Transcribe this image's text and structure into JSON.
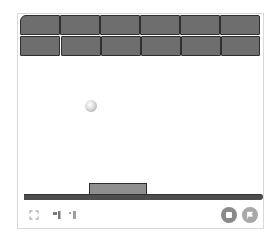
{
  "game": {
    "title": "Breakout",
    "colors": {
      "brick_fill": "#6e6e6e",
      "brick_border": "#2f2f2f",
      "paddle_fill": "#8f8f8f",
      "floor": "#4d4d4d",
      "frame_border": "#d9d9d9",
      "button_stop": "#8a8a8a",
      "button_go": "#a8a8a8"
    },
    "bricks": {
      "rows": 2,
      "columns": 6,
      "grid": [
        [
          1,
          1,
          1,
          1,
          1,
          1
        ],
        [
          1,
          1,
          1,
          1,
          1,
          1
        ]
      ]
    },
    "ball": {
      "x": 90,
      "y": 105
    },
    "paddle": {
      "x": 88,
      "y": 182,
      "width": 58
    }
  },
  "controls": {
    "left": [
      {
        "name": "fullscreen",
        "icon": "fullscreen-icon"
      },
      {
        "name": "small-stage",
        "icon": "small-stage-icon"
      },
      {
        "name": "normal-stage",
        "icon": "normal-stage-icon"
      }
    ],
    "right": [
      {
        "name": "stop",
        "icon": "stop-icon"
      },
      {
        "name": "green-flag",
        "icon": "flag-icon"
      }
    ]
  }
}
